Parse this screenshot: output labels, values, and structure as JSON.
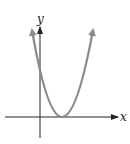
{
  "figure": {
    "type": "graph-of-function",
    "axes": {
      "x_label": "x",
      "y_label": "y",
      "axis_color": "#222222"
    },
    "curve": {
      "shape": "parabola",
      "opens": "up",
      "vertex_on_x_axis": true,
      "vertex_position": "right of y-axis",
      "y_intercept": "positive",
      "arrowheads_on_ends": true,
      "color": "#8a8a8a"
    }
  }
}
